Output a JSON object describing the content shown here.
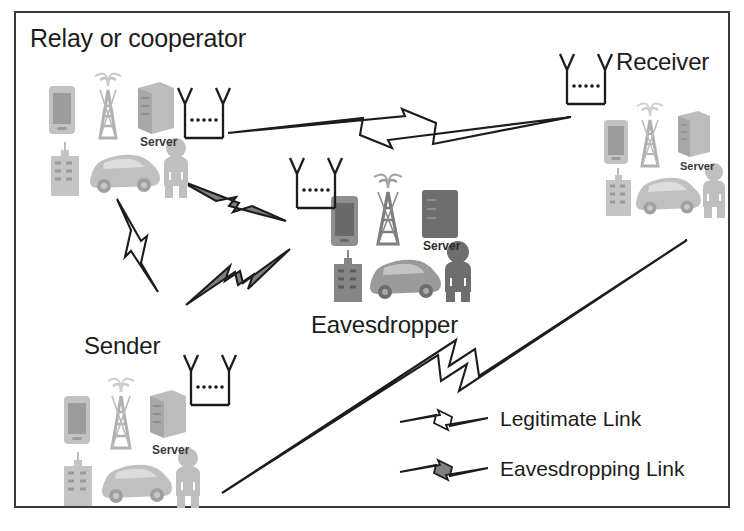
{
  "figure": {
    "background_color": "#ffffff",
    "frame_color": "#3a3a3a"
  },
  "groups": [
    {
      "id": "relay",
      "label": "Relay or cooperator",
      "role": "relay",
      "shade": "light",
      "devices": [
        "smartphone-icon",
        "cell-tower-icon",
        "server-icon",
        "building-icon",
        "car-icon",
        "person-icon"
      ],
      "server_label": "Server",
      "antenna": "dipole-antenna-icon"
    },
    {
      "id": "receiver",
      "label": "Receiver",
      "role": "receiver",
      "shade": "light",
      "devices": [
        "smartphone-icon",
        "cell-tower-icon",
        "server-icon",
        "building-icon",
        "car-icon",
        "person-icon"
      ],
      "server_label": "Server",
      "antenna": "dipole-antenna-icon"
    },
    {
      "id": "eavesdropper",
      "label": "Eavesdropper",
      "role": "eavesdropper",
      "shade": "dark",
      "devices": [
        "smartphone-icon",
        "cell-tower-icon",
        "server-icon",
        "building-icon",
        "car-icon",
        "person-icon"
      ],
      "server_label": "Server",
      "antenna": "dipole-antenna-icon"
    },
    {
      "id": "sender",
      "label": "Sender",
      "role": "sender",
      "shade": "light",
      "devices": [
        "smartphone-icon",
        "cell-tower-icon",
        "server-icon",
        "building-icon",
        "car-icon",
        "person-icon"
      ],
      "server_label": "Server",
      "antenna": "dipole-antenna-icon"
    }
  ],
  "links": [
    {
      "id": "relay-to-receiver",
      "type": "legitimate",
      "from": "relay",
      "to": "receiver"
    },
    {
      "id": "sender-to-relay",
      "type": "legitimate",
      "from": "sender",
      "to": "relay"
    },
    {
      "id": "sender-to-receiver",
      "type": "legitimate",
      "from": "sender",
      "to": "receiver"
    },
    {
      "id": "relay-to-eavesdropper",
      "type": "eavesdropping",
      "from": "relay",
      "to": "eavesdropper"
    },
    {
      "id": "sender-to-eavesdropper",
      "type": "eavesdropping",
      "from": "sender",
      "to": "eavesdropper"
    }
  ],
  "legend": {
    "items": [
      {
        "label": "Legitimate Link",
        "symbol": "lightning-bolt-hollow-icon",
        "fill": "#ffffff",
        "stroke": "#1c1c1c"
      },
      {
        "label": "Eavesdropping Link",
        "symbol": "lightning-bolt-filled-icon",
        "fill": "#808080",
        "stroke": "#1c1c1c"
      }
    ]
  },
  "colors": {
    "bolt_legitimate_fill": "#ffffff",
    "bolt_eavesdropping_fill": "#808080",
    "bolt_stroke": "#1c1c1c",
    "icon_light": "#b4b4b4",
    "icon_dark": "#6e6e6e",
    "text": "#1c1c1c"
  }
}
